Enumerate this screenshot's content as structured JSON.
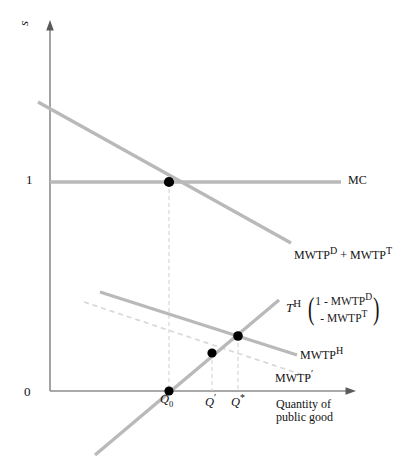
{
  "figure": {
    "type": "economics-line-diagram",
    "axes": {
      "y_label": "s",
      "y_ticks": [
        {
          "value": "1",
          "pixel_y": 182
        },
        {
          "value": "0",
          "pixel_y": 391
        }
      ],
      "x_title_line1": "Quantity of",
      "x_title_line2": "public good",
      "x_ticks": [
        {
          "label": "Q",
          "sub": "0",
          "sup": "",
          "pixel_x": 169
        },
        {
          "label": "Q",
          "sub": "",
          "sup": "′",
          "pixel_x": 212
        },
        {
          "label": "Q",
          "sub": "",
          "sup": "*",
          "pixel_x": 238
        }
      ]
    },
    "curves": {
      "mc": {
        "label": "MC",
        "style": "solid",
        "color": "#b9b9b9",
        "description": "horizontal marginal cost line at s = 1"
      },
      "aggregate_demand": {
        "label_text": "MWTP",
        "label_sup_1": "D",
        "label_plus": " + ",
        "label_text_2": "MWTP",
        "label_sup_2": "T",
        "style": "solid",
        "color": "#b9b9b9",
        "description": "downward sloping aggregate marginal willingness to pay"
      },
      "th": {
        "label": "T",
        "label_sup": "H",
        "bracket_row_1": "1 - MWTP",
        "bracket_row_1_sup": "D",
        "bracket_row_2": "- MWTP",
        "bracket_row_2_sup": "T",
        "style": "solid",
        "color": "#b9b9b9",
        "description": "upward sloping tax share line crossing axis at Q0"
      },
      "mwtp_h": {
        "label": "MWTP",
        "label_sup": "H",
        "style": "solid",
        "color": "#b9b9b9",
        "description": "downward sloping household marginal willingness to pay"
      },
      "mwtp_prime": {
        "label": "MWTP",
        "label_sup": "′",
        "style": "dashed",
        "color": "#d8d8d8",
        "description": "dashed shifted household marginal willingness to pay"
      }
    },
    "points": [
      {
        "name": "mc-demand-intersection",
        "x": 169,
        "y": 182
      },
      {
        "name": "q0-axis-point",
        "x": 169,
        "y": 391
      },
      {
        "name": "mwtp-prime-th-intersection",
        "x": 212,
        "y": 353
      },
      {
        "name": "mwtp-h-th-intersection",
        "x": 238,
        "y": 336
      }
    ],
    "colors": {
      "curve_gray": "#b9b9b9",
      "dashed_gray": "#d8d8d8",
      "axis": "#8c8c8c",
      "text": "#111111",
      "point": "#000000",
      "background": "#ffffff"
    }
  }
}
